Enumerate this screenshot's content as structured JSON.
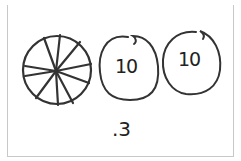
{
  "figure": {
    "disk_segments": 10,
    "ten_disks": [
      {
        "label": "10"
      },
      {
        "label": "10"
      }
    ],
    "caption": ".3",
    "colors": {
      "stroke": "#333333",
      "frame_top": "#bdbdbd",
      "background": "#ffffff"
    }
  }
}
